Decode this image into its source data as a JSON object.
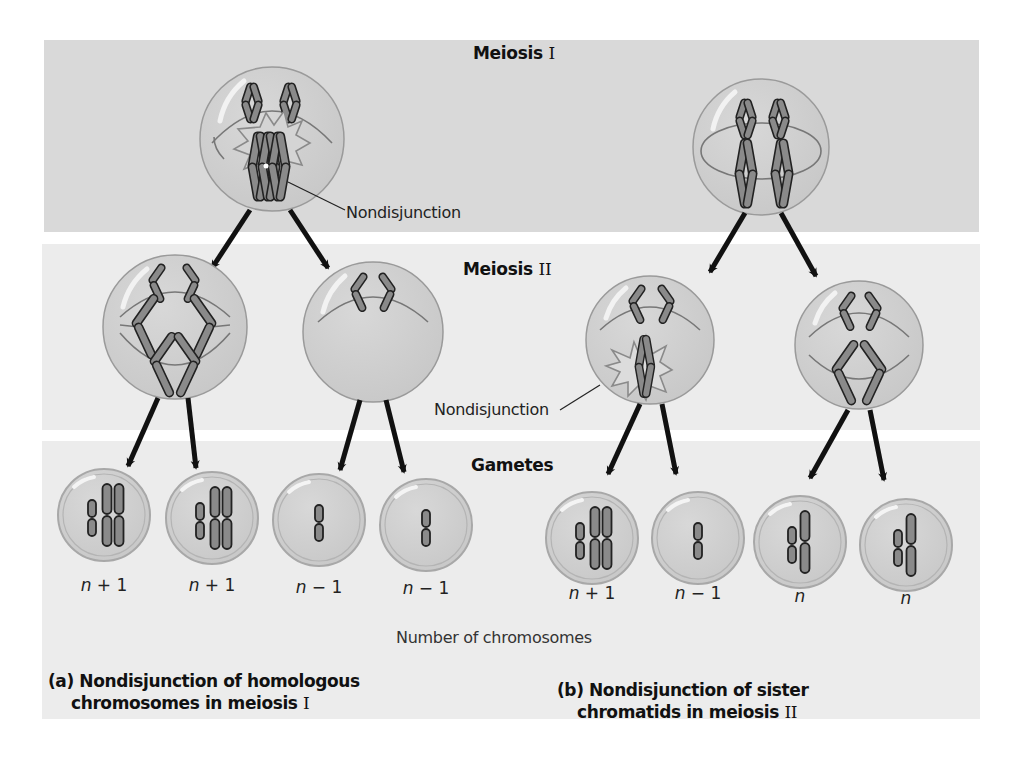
{
  "rows": {
    "meiosis1": {
      "label": "Meiosis ",
      "roman": "I"
    },
    "meiosis2": {
      "label": "Meiosis ",
      "roman": "II"
    },
    "gametes": {
      "label": "Gametes"
    }
  },
  "annotations": {
    "nondisjunction_a": "Nondisjunction",
    "nondisjunction_b": "Nondisjunction"
  },
  "gamete_counts": {
    "a": [
      {
        "var": "n",
        "op": " + 1"
      },
      {
        "var": "n",
        "op": " + 1"
      },
      {
        "var": "n",
        "op": " − 1"
      },
      {
        "var": "n",
        "op": " − 1"
      }
    ],
    "b": [
      {
        "var": "n",
        "op": " + 1"
      },
      {
        "var": "n",
        "op": " − 1"
      },
      {
        "var": "n",
        "op": ""
      },
      {
        "var": "n",
        "op": ""
      }
    ]
  },
  "axis_label": "Number of chromosomes",
  "captions": {
    "a": {
      "line1": "(a) Nondisjunction of homologous",
      "line2": "chromosomes in meiosis ",
      "roman": "I"
    },
    "b": {
      "line1": "(b) Nondisjunction of sister",
      "line2": "chromatids in meiosis ",
      "roman": "II"
    }
  },
  "colors": {
    "panel_top": "#d9d9d9",
    "panel_light": "#ececec",
    "cell_fill": "#cfcfcf",
    "cell_stroke": "#9a9a9a",
    "chromosome_fill": "#8a8a8a",
    "chromosome_stroke": "#222222",
    "arrow": "#111111"
  }
}
